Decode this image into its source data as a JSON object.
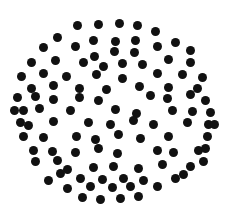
{
  "figure": {
    "type": "scatter",
    "width": 229,
    "height": 216,
    "background_color": "#ffffff",
    "dot_color": "#111111",
    "dot_diameter": 9,
    "dot_count": 110,
    "shape": "circle",
    "circle_center": [
      115,
      110
    ],
    "circle_radius": 104
  },
  "chart_data": {
    "type": "scatter",
    "xlabel": "",
    "ylabel": "",
    "xlim": [
      0,
      229
    ],
    "ylim": [
      0,
      216
    ],
    "grid": false,
    "legend": "none",
    "marker": "circle",
    "marker_size": 9,
    "marker_color": "#111111",
    "series": [
      {
        "name": "dots",
        "points": [
          [
            77,
            25
          ],
          [
            98,
            24
          ],
          [
            119,
            23
          ],
          [
            137,
            25
          ],
          [
            155,
            31
          ],
          [
            57,
            37
          ],
          [
            93,
            40
          ],
          [
            115,
            41
          ],
          [
            135,
            40
          ],
          [
            175,
            42
          ],
          [
            43,
            47
          ],
          [
            75,
            46
          ],
          [
            94,
            56
          ],
          [
            114,
            51
          ],
          [
            134,
            52
          ],
          [
            157,
            46
          ],
          [
            190,
            50
          ],
          [
            31,
            62
          ],
          [
            55,
            60
          ],
          [
            83,
            62
          ],
          [
            103,
            66
          ],
          [
            122,
            63
          ],
          [
            142,
            64
          ],
          [
            168,
            59
          ],
          [
            190,
            62
          ],
          [
            21,
            76
          ],
          [
            43,
            73
          ],
          [
            66,
            76
          ],
          [
            96,
            74
          ],
          [
            122,
            78
          ],
          [
            157,
            73
          ],
          [
            182,
            74
          ],
          [
            202,
            77
          ],
          [
            31,
            88
          ],
          [
            53,
            85
          ],
          [
            79,
            88
          ],
          [
            106,
            89
          ],
          [
            139,
            86
          ],
          [
            168,
            87
          ],
          [
            197,
            88
          ],
          [
            17,
            97
          ],
          [
            35,
            96
          ],
          [
            53,
            99
          ],
          [
            79,
            97
          ],
          [
            98,
            100
          ],
          [
            150,
            95
          ],
          [
            167,
            98
          ],
          [
            190,
            94
          ],
          [
            205,
            100
          ],
          [
            23,
            110
          ],
          [
            39,
            108
          ],
          [
            70,
            110
          ],
          [
            115,
            109
          ],
          [
            136,
            113
          ],
          [
            172,
            110
          ],
          [
            192,
            111
          ],
          [
            210,
            112
          ],
          [
            20,
            122
          ],
          [
            53,
            121
          ],
          [
            88,
            122
          ],
          [
            110,
            124
          ],
          [
            133,
            120
          ],
          [
            153,
            124
          ],
          [
            187,
            122
          ],
          [
            208,
            124
          ],
          [
            23,
            136
          ],
          [
            43,
            137
          ],
          [
            76,
            136
          ],
          [
            95,
            139
          ],
          [
            118,
            134
          ],
          [
            140,
            138
          ],
          [
            168,
            136
          ],
          [
            207,
            136
          ],
          [
            33,
            150
          ],
          [
            52,
            151
          ],
          [
            75,
            152
          ],
          [
            98,
            148
          ],
          [
            117,
            153
          ],
          [
            157,
            150
          ],
          [
            173,
            152
          ],
          [
            198,
            150
          ],
          [
            35,
            161
          ],
          [
            57,
            160
          ],
          [
            67,
            169
          ],
          [
            93,
            167
          ],
          [
            113,
            166
          ],
          [
            138,
            168
          ],
          [
            162,
            164
          ],
          [
            190,
            166
          ],
          [
            203,
            161
          ],
          [
            48,
            180
          ],
          [
            80,
            178
          ],
          [
            102,
            179
          ],
          [
            123,
            178
          ],
          [
            143,
            180
          ],
          [
            175,
            178
          ],
          [
            67,
            188
          ],
          [
            90,
            186
          ],
          [
            112,
            187
          ],
          [
            130,
            186
          ],
          [
            157,
            186
          ],
          [
            82,
            197
          ],
          [
            100,
            199
          ],
          [
            120,
            198
          ],
          [
            138,
            196
          ],
          [
            60,
            173
          ],
          [
            183,
            174
          ],
          [
            28,
            125
          ],
          [
            205,
            148
          ],
          [
            14,
            110
          ],
          [
            214,
            124
          ]
        ]
      }
    ]
  }
}
